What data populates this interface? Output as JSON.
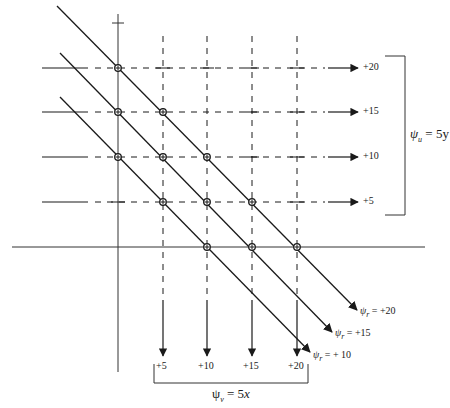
{
  "figure": {
    "colors": {
      "ink": "#1a1a1a",
      "background": "#ffffff"
    }
  },
  "horizontal_streamlines": {
    "group_label_symbol": "ψ",
    "group_label_sub": "u",
    "group_label_eq": " = 5y",
    "values": [
      "+20",
      "+15",
      "+10",
      "+5"
    ],
    "y_positions": [
      68,
      112,
      157,
      202
    ]
  },
  "vertical_streamlines": {
    "group_label_symbol": "ψ",
    "group_label_sub": "v",
    "group_label_eq": " = 5",
    "group_label_var": "x",
    "values": [
      "+5",
      "+10",
      "+15",
      "+20"
    ],
    "x_positions": [
      163,
      207,
      252,
      297
    ]
  },
  "resultant_streamlines": {
    "labels": [
      {
        "symbol": "ψ",
        "sub": "r",
        "eq": " = +20"
      },
      {
        "symbol": "ψ",
        "sub": "r",
        "eq": " = +15"
      },
      {
        "symbol": "ψ",
        "sub": "r",
        "eq": " = + 10"
      }
    ]
  },
  "axes": {
    "x_axis_y": 247,
    "y_axis_x": 118
  }
}
